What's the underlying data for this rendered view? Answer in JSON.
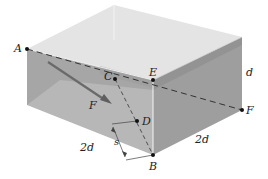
{
  "diagram": {
    "type": "3d-box-with-force",
    "points": {
      "A": {
        "label": "A",
        "x": 27,
        "y": 49
      },
      "B": {
        "label": "B",
        "x": 153,
        "y": 155
      },
      "C": {
        "label": "C",
        "x": 115,
        "y": 79
      },
      "D": {
        "label": "D",
        "x": 137,
        "y": 121
      },
      "E": {
        "label": "E",
        "x": 153,
        "y": 80
      },
      "F": {
        "label": "F",
        "x": 242,
        "y": 110
      }
    },
    "force_label": "F",
    "dimensions": {
      "height": "d",
      "front_left_edge": "2d",
      "front_right_edge": "2d",
      "perpendicular_distance": "s"
    },
    "colors": {
      "top_face": "#e6e6e6",
      "left_face": "#a9a9a9",
      "front_face": "#b9b9b9",
      "right_face": "#9a9a9a",
      "shadow_band": "#8f8f8f",
      "force_arrow": "#6e6e6e",
      "lines": "#333333"
    }
  }
}
